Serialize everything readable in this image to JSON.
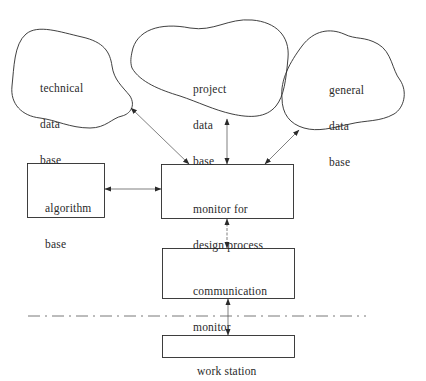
{
  "diagram": {
    "type": "block-diagram",
    "nodes": {
      "technical_db": {
        "shape": "cloud",
        "lines": [
          "technical",
          "data",
          "base"
        ]
      },
      "project_db": {
        "shape": "cloud",
        "lines": [
          "project",
          "data",
          "base"
        ]
      },
      "general_db": {
        "shape": "cloud",
        "lines": [
          "general",
          "data",
          "base"
        ]
      },
      "algorithm_base": {
        "shape": "rectangle",
        "lines": [
          "algorithm",
          "base"
        ]
      },
      "monitor": {
        "shape": "rectangle",
        "lines": [
          "monitor for",
          "design process"
        ]
      },
      "comm_monitor": {
        "shape": "rectangle",
        "lines": [
          "communication",
          "monitor"
        ]
      },
      "work_station": {
        "shape": "rectangle",
        "lines": [
          "work station"
        ]
      }
    },
    "edges": [
      {
        "from": "technical_db",
        "to": "monitor",
        "style": "bidirectional"
      },
      {
        "from": "project_db",
        "to": "monitor",
        "style": "bidirectional"
      },
      {
        "from": "general_db",
        "to": "monitor",
        "style": "bidirectional"
      },
      {
        "from": "algorithm_base",
        "to": "monitor",
        "style": "bidirectional"
      },
      {
        "from": "monitor",
        "to": "comm_monitor",
        "style": "bidirectional"
      },
      {
        "from": "comm_monitor",
        "to": "work_station",
        "style": "bidirectional"
      }
    ],
    "separator": {
      "style": "dash-dot",
      "between": [
        "comm_monitor",
        "work_station"
      ]
    },
    "colors": {
      "stroke": "#2a2a2a",
      "background": "#ffffff"
    }
  }
}
